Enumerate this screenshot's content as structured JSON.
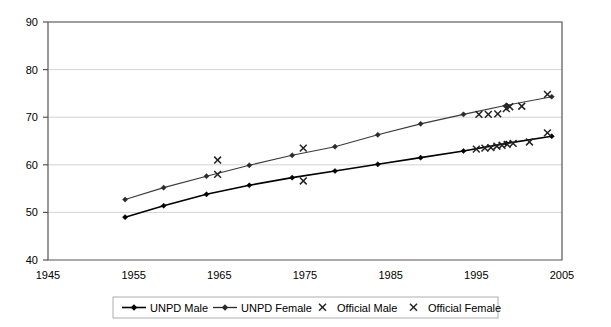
{
  "chart_data": {
    "type": "line",
    "title": "",
    "xlabel": "",
    "ylabel": "",
    "xlim": [
      1945,
      2005
    ],
    "ylim": [
      40,
      90
    ],
    "xticks": [
      1945,
      1955,
      1965,
      1975,
      1985,
      1995,
      2005
    ],
    "yticks": [
      40,
      50,
      60,
      70,
      80,
      90
    ],
    "grid": true,
    "legend_position": "bottom",
    "series": [
      {
        "name": "UNPD Male",
        "type": "line",
        "marker": "diamond",
        "color": "#000000",
        "points": [
          [
            1954.0,
            49.0
          ],
          [
            1958.5,
            51.4
          ],
          [
            1963.5,
            53.8
          ],
          [
            1968.5,
            55.7
          ],
          [
            1973.5,
            57.3
          ],
          [
            1978.5,
            58.7
          ],
          [
            1983.5,
            60.1
          ],
          [
            1988.5,
            61.5
          ],
          [
            1993.5,
            62.9
          ],
          [
            1998.5,
            64.5
          ],
          [
            2003.8,
            66.0
          ]
        ]
      },
      {
        "name": "UNPD Female",
        "type": "line",
        "marker": "diamond",
        "color": "#2b2b2b",
        "points": [
          [
            1954.0,
            52.7
          ],
          [
            1958.5,
            55.2
          ],
          [
            1963.5,
            57.6
          ],
          [
            1968.5,
            59.9
          ],
          [
            1973.5,
            62.0
          ],
          [
            1978.5,
            63.8
          ],
          [
            1983.5,
            66.3
          ],
          [
            1988.5,
            68.6
          ],
          [
            1993.5,
            70.6
          ],
          [
            1998.5,
            72.5
          ],
          [
            2003.8,
            74.3
          ]
        ]
      },
      {
        "name": "Official Male",
        "type": "scatter",
        "marker": "x",
        "color": "#222222",
        "points": [
          [
            1964.8,
            58.0
          ],
          [
            1974.8,
            56.6
          ],
          [
            1995.0,
            63.3
          ],
          [
            1996.0,
            63.5
          ],
          [
            1996.7,
            63.6
          ],
          [
            1997.4,
            63.9
          ],
          [
            1998.0,
            64.1
          ],
          [
            1998.6,
            64.3
          ],
          [
            1999.3,
            64.5
          ],
          [
            2001.2,
            64.8
          ],
          [
            2003.3,
            66.7
          ]
        ]
      },
      {
        "name": "Official Female",
        "type": "scatter",
        "marker": "x",
        "color": "#222222",
        "points": [
          [
            1964.8,
            61.0
          ],
          [
            1974.8,
            63.5
          ],
          [
            1995.3,
            70.6
          ],
          [
            1996.4,
            70.6
          ],
          [
            1997.5,
            70.7
          ],
          [
            1998.5,
            71.8
          ],
          [
            1998.9,
            72.2
          ],
          [
            2000.3,
            72.3
          ],
          [
            2003.3,
            74.8
          ]
        ]
      }
    ]
  },
  "legend": {
    "entries": [
      {
        "label": "UNPD Male",
        "marker": "line-diamond"
      },
      {
        "label": "UNPD Female",
        "marker": "line-diamond"
      },
      {
        "label": "Official Male",
        "marker": "x"
      },
      {
        "label": "Official Female",
        "marker": "x"
      }
    ]
  },
  "axes": {
    "y_tick_labels": [
      "90",
      "80",
      "70",
      "60",
      "50",
      "40"
    ],
    "x_tick_labels": [
      "1945",
      "1955",
      "1965",
      "1975",
      "1985",
      "1995",
      "2005"
    ]
  }
}
